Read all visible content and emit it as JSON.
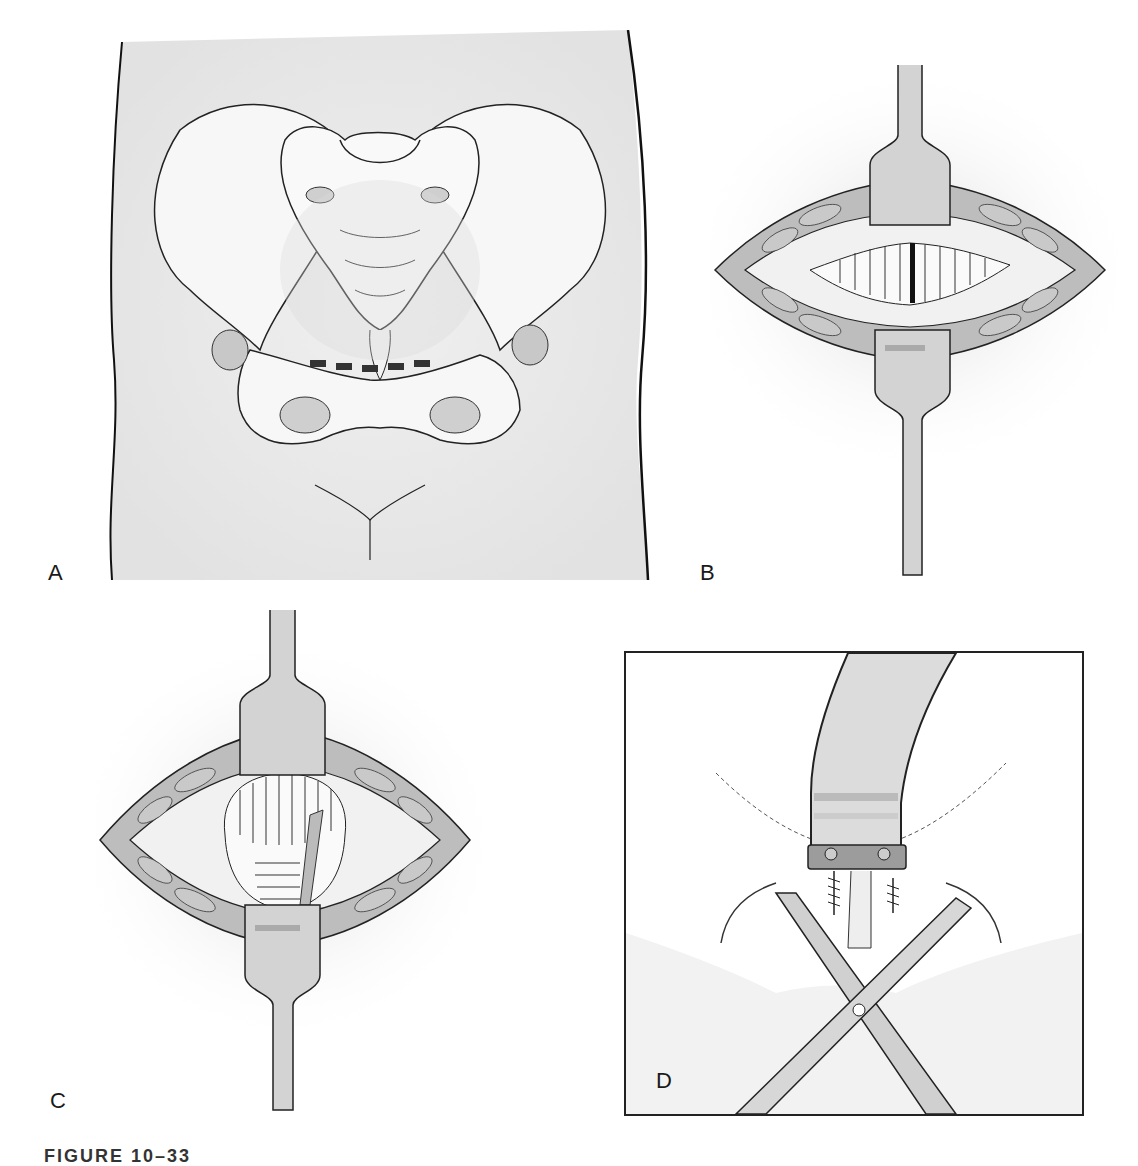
{
  "figure": {
    "caption": "FIGURE 10–33",
    "panels": [
      {
        "id": "A",
        "label": "A",
        "description": "Anterior view of pelvis within torso outline, dashed incision line above pubic symphysis"
      },
      {
        "id": "B",
        "label": "B",
        "description": "Pfannenstiel-type incision held open by two retractors, exposing vertical fascial fibers with midline separation"
      },
      {
        "id": "C",
        "label": "C",
        "description": "Retracted incision exposing rounded bladder/symphysis region with horizontal fibers and hatched plate"
      },
      {
        "id": "D",
        "label": "D",
        "description": "Boxed detail: curved plate fixed with two screws over symphysis, crossed scissors/clamp below"
      }
    ]
  },
  "colors": {
    "line": "#1a1a1a",
    "skin_shade": "#e6e6e6",
    "muscle": "#bdbdbd",
    "retractor": "#d0d0d0",
    "incision_dash": "#333333"
  }
}
